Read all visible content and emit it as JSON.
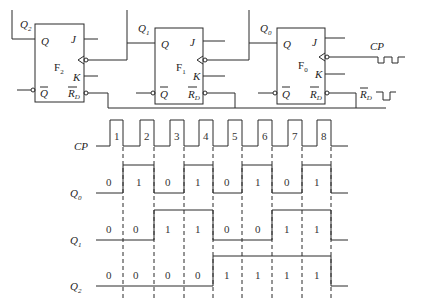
{
  "circuit": {
    "flip_flops": [
      {
        "name": "F",
        "index": "2",
        "output_label": "Q",
        "output_index": "2",
        "pins": {
          "q": "Q",
          "qbar": "Q",
          "j": "J",
          "k": "K",
          "rd": "R",
          "rd_sub": "D"
        }
      },
      {
        "name": "F",
        "index": "1",
        "output_label": "Q",
        "output_index": "1",
        "pins": {
          "q": "Q",
          "qbar": "Q",
          "j": "J",
          "k": "K",
          "rd": "R",
          "rd_sub": "D"
        }
      },
      {
        "name": "F",
        "index": "0",
        "output_label": "Q",
        "output_index": "0",
        "pins": {
          "q": "Q",
          "qbar": "Q",
          "j": "J",
          "k": "K",
          "rd": "R",
          "rd_sub": "D"
        }
      }
    ],
    "inputs": {
      "cp_label": "CP",
      "rd_label": "R",
      "rd_sub": "D"
    }
  },
  "timing": {
    "cp_label": "CP",
    "pulse_numbers": [
      "1",
      "2",
      "3",
      "4",
      "5",
      "6",
      "7",
      "8"
    ],
    "signals": [
      {
        "label": "Q",
        "sub": "0",
        "values": [
          "0",
          "1",
          "0",
          "1",
          "0",
          "1",
          "0",
          "1"
        ]
      },
      {
        "label": "Q",
        "sub": "1",
        "values": [
          "0",
          "0",
          "1",
          "1",
          "0",
          "0",
          "1",
          "1"
        ]
      },
      {
        "label": "Q",
        "sub": "2",
        "values": [
          "0",
          "0",
          "0",
          "0",
          "1",
          "1",
          "1",
          "1"
        ]
      }
    ]
  }
}
